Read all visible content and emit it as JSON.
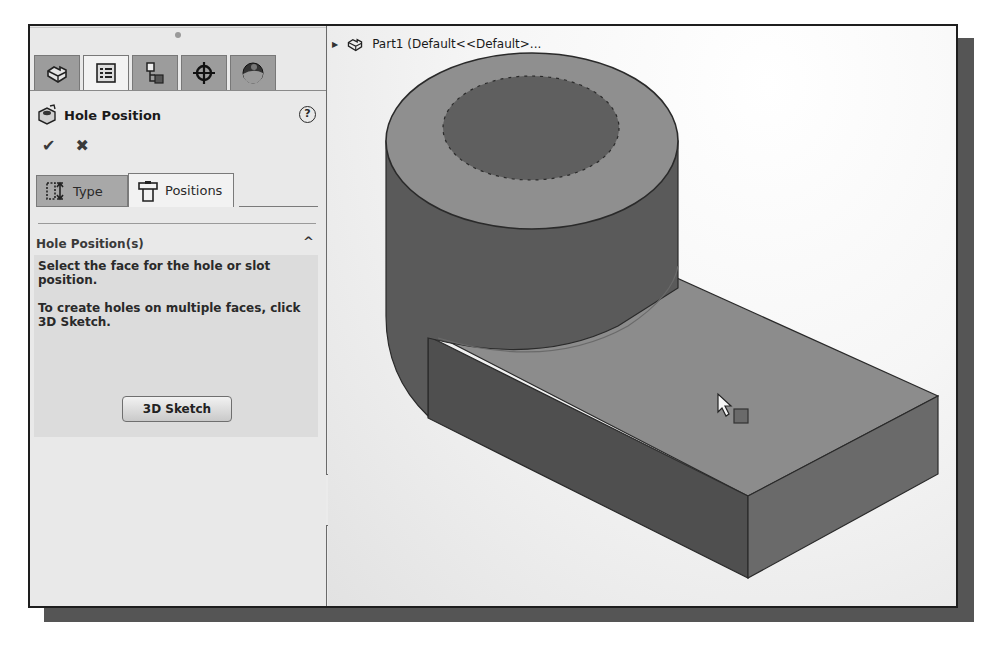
{
  "panel": {
    "manager_tabs": [
      {
        "id": "featuremanager",
        "icon": "part-icon",
        "active": false
      },
      {
        "id": "propertymanager",
        "icon": "property-list-icon",
        "active": true
      },
      {
        "id": "configurationmanager",
        "icon": "configuration-icon",
        "active": false
      },
      {
        "id": "dimxpertmanager",
        "icon": "crosshair-icon",
        "active": false
      },
      {
        "id": "displaymanager",
        "icon": "appearance-sphere-icon",
        "active": false
      }
    ],
    "title": "Hole Position",
    "help_label": "?",
    "ok_label": "✔",
    "cancel_label": "✖",
    "sub_tabs": [
      {
        "label": "Type",
        "icon": "hole-type-icon",
        "active": false
      },
      {
        "label": "Positions",
        "icon": "hole-position-icon",
        "active": true
      }
    ],
    "group": {
      "title": "Hole Position(s)",
      "collapse_glyph": "^",
      "message1": "Select the face for the hole or slot position.",
      "message2": "To create holes on multiple faces, click 3D Sketch.",
      "button_label": "3D Sketch"
    }
  },
  "viewport": {
    "tree_label": "Part1  (Default<<Default>...",
    "expand_glyph": "▶",
    "model_colors": {
      "top_face": "#8a8a8a",
      "side_face": "#5c5c5c",
      "front_face": "#4e4e4e",
      "hole": "#5e5e5e",
      "edge": "#2a2a2a"
    }
  }
}
